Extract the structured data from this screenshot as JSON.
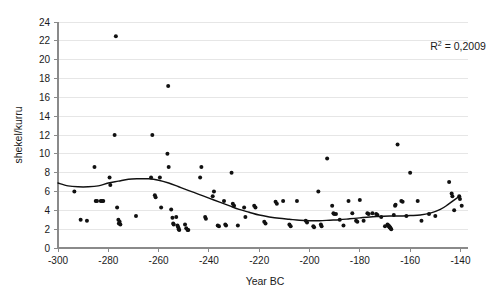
{
  "chart_data": {
    "type": "scatter",
    "title": "",
    "xlabel": "Year BC",
    "ylabel": "shekel/kurru",
    "xlim": [
      -300,
      -137
    ],
    "ylim": [
      0,
      24
    ],
    "xticks": [
      -300,
      -280,
      -260,
      -240,
      -220,
      -200,
      -180,
      -160,
      -140
    ],
    "yticks": [
      0,
      2,
      4,
      6,
      8,
      10,
      12,
      14,
      16,
      18,
      20,
      22,
      24
    ],
    "xticklabels": [
      "-300",
      "-280",
      "-260",
      "-240",
      "-220",
      "-200",
      "-180",
      "-160",
      "-140"
    ],
    "yticklabels": [
      "0",
      "2",
      "4",
      "6",
      "8",
      "10",
      "12",
      "14",
      "16",
      "18",
      "20",
      "22",
      "24"
    ],
    "grid": true,
    "grid_axis": "y",
    "legend": false,
    "marker": "filled-circle",
    "marker_color": "#111111",
    "annotations": [
      {
        "name": "r-squared",
        "text": "R2 = 0,2009",
        "display_base": "R",
        "display_sup": "2",
        "display_rest": " = 0,2009",
        "x": -152,
        "y": 21.0
      }
    ],
    "series": [
      {
        "name": "Barley prices",
        "points": [
          [
            -293.5,
            6.0
          ],
          [
            -291.0,
            3.0
          ],
          [
            -288.5,
            2.9
          ],
          [
            -285.5,
            8.6
          ],
          [
            -285.0,
            5.0
          ],
          [
            -284.5,
            5.0
          ],
          [
            -283.0,
            5.0
          ],
          [
            -282.5,
            5.0
          ],
          [
            -282.0,
            5.0
          ],
          [
            -279.5,
            7.5
          ],
          [
            -279.2,
            6.7
          ],
          [
            -277.5,
            12.0
          ],
          [
            -277.0,
            22.5
          ],
          [
            -276.5,
            4.3
          ],
          [
            -276.0,
            3.0
          ],
          [
            -275.8,
            2.6
          ],
          [
            -275.5,
            2.8
          ],
          [
            -275.2,
            2.5
          ],
          [
            -269.0,
            3.4
          ],
          [
            -263.0,
            7.5
          ],
          [
            -262.5,
            12.0
          ],
          [
            -261.5,
            5.6
          ],
          [
            -261.2,
            5.4
          ],
          [
            -259.5,
            7.5
          ],
          [
            -259.0,
            4.3
          ],
          [
            -256.5,
            10.0
          ],
          [
            -256.0,
            8.6
          ],
          [
            -256.2,
            17.2
          ],
          [
            -255.0,
            4.1
          ],
          [
            -254.5,
            3.2
          ],
          [
            -254.2,
            2.6
          ],
          [
            -254.0,
            2.5
          ],
          [
            -253.0,
            3.3
          ],
          [
            -252.5,
            2.4
          ],
          [
            -252.2,
            2.2
          ],
          [
            -252.0,
            2.0
          ],
          [
            -251.8,
            1.9
          ],
          [
            -249.5,
            2.5
          ],
          [
            -249.0,
            2.1
          ],
          [
            -248.5,
            1.9
          ],
          [
            -248.2,
            1.9
          ],
          [
            -243.5,
            7.5
          ],
          [
            -243.0,
            8.6
          ],
          [
            -241.5,
            3.3
          ],
          [
            -241.2,
            3.1
          ],
          [
            -238.5,
            5.5
          ],
          [
            -238.0,
            6.0
          ],
          [
            -236.5,
            2.4
          ],
          [
            -236.0,
            2.3
          ],
          [
            -234.0,
            5.0
          ],
          [
            -233.5,
            2.5
          ],
          [
            -233.2,
            2.4
          ],
          [
            -231.0,
            8.0
          ],
          [
            -230.5,
            4.7
          ],
          [
            -230.0,
            4.5
          ],
          [
            -228.5,
            2.4
          ],
          [
            -226.0,
            4.3
          ],
          [
            -225.5,
            3.3
          ],
          [
            -222.0,
            4.5
          ],
          [
            -221.5,
            4.3
          ],
          [
            -218.0,
            2.8
          ],
          [
            -217.5,
            2.6
          ],
          [
            -213.5,
            4.9
          ],
          [
            -213.0,
            4.7
          ],
          [
            -210.5,
            5.0
          ],
          [
            -208.0,
            2.5
          ],
          [
            -207.5,
            2.3
          ],
          [
            -205.0,
            5.0
          ],
          [
            -201.5,
            2.9
          ],
          [
            -201.0,
            2.7
          ],
          [
            -198.5,
            2.3
          ],
          [
            -198.2,
            2.2
          ],
          [
            -196.5,
            6.0
          ],
          [
            -195.5,
            2.5
          ],
          [
            -195.2,
            2.3
          ],
          [
            -193.0,
            9.5
          ],
          [
            -191.0,
            4.5
          ],
          [
            -190.5,
            3.7
          ],
          [
            -190.2,
            3.6
          ],
          [
            -189.5,
            3.6
          ],
          [
            -188.0,
            3.0
          ],
          [
            -186.5,
            2.4
          ],
          [
            -184.5,
            5.0
          ],
          [
            -183.0,
            3.7
          ],
          [
            -181.5,
            2.9
          ],
          [
            -181.0,
            2.8
          ],
          [
            -180.0,
            5.1
          ],
          [
            -178.5,
            2.9
          ],
          [
            -177.0,
            3.7
          ],
          [
            -176.5,
            3.6
          ],
          [
            -175.0,
            3.7
          ],
          [
            -173.5,
            3.6
          ],
          [
            -173.0,
            3.5
          ],
          [
            -171.5,
            3.3
          ],
          [
            -170.0,
            2.3
          ],
          [
            -169.0,
            2.5
          ],
          [
            -168.8,
            2.4
          ],
          [
            -168.6,
            2.4
          ],
          [
            -168.4,
            2.3
          ],
          [
            -168.2,
            2.2
          ],
          [
            -168.0,
            2.2
          ],
          [
            -167.8,
            2.1
          ],
          [
            -167.5,
            2.0
          ],
          [
            -166.5,
            3.5
          ],
          [
            -166.0,
            4.5
          ],
          [
            -165.8,
            4.6
          ],
          [
            -165.0,
            11.0
          ],
          [
            -163.5,
            5.0
          ],
          [
            -163.0,
            4.9
          ],
          [
            -161.5,
            3.4
          ],
          [
            -160.0,
            8.0
          ],
          [
            -157.0,
            5.0
          ],
          [
            -155.5,
            2.9
          ],
          [
            -152.5,
            3.6
          ],
          [
            -150.0,
            3.4
          ],
          [
            -144.5,
            7.0
          ],
          [
            -143.5,
            5.8
          ],
          [
            -143.2,
            5.5
          ],
          [
            -142.5,
            4.0
          ],
          [
            -140.5,
            5.5
          ],
          [
            -140.2,
            5.2
          ],
          [
            -139.5,
            4.5
          ]
        ]
      }
    ],
    "trendline": {
      "name": "polynomial-fit",
      "r_squared": 0.2009,
      "points": [
        [
          -300,
          6.9
        ],
        [
          -296,
          6.6
        ],
        [
          -292,
          6.5
        ],
        [
          -288,
          6.5
        ],
        [
          -284,
          6.6
        ],
        [
          -280,
          6.9
        ],
        [
          -276,
          7.1
        ],
        [
          -272,
          7.3
        ],
        [
          -268,
          7.35
        ],
        [
          -264,
          7.35
        ],
        [
          -260,
          7.2
        ],
        [
          -256,
          6.9
        ],
        [
          -252,
          6.5
        ],
        [
          -248,
          6.1
        ],
        [
          -244,
          5.7
        ],
        [
          -240,
          5.3
        ],
        [
          -236,
          4.9
        ],
        [
          -232,
          4.5
        ],
        [
          -228,
          4.1
        ],
        [
          -224,
          3.8
        ],
        [
          -220,
          3.5
        ],
        [
          -216,
          3.3
        ],
        [
          -212,
          3.15
        ],
        [
          -208,
          3.05
        ],
        [
          -204,
          2.95
        ],
        [
          -200,
          2.9
        ],
        [
          -196,
          2.9
        ],
        [
          -192,
          2.95
        ],
        [
          -188,
          3.0
        ],
        [
          -184,
          3.1
        ],
        [
          -180,
          3.2
        ],
        [
          -176,
          3.3
        ],
        [
          -172,
          3.35
        ],
        [
          -168,
          3.4
        ],
        [
          -164,
          3.4
        ],
        [
          -160,
          3.45
        ],
        [
          -156,
          3.5
        ],
        [
          -152,
          3.7
        ],
        [
          -148,
          4.1
        ],
        [
          -145,
          4.6
        ],
        [
          -142,
          5.2
        ],
        [
          -140,
          5.5
        ]
      ]
    }
  }
}
